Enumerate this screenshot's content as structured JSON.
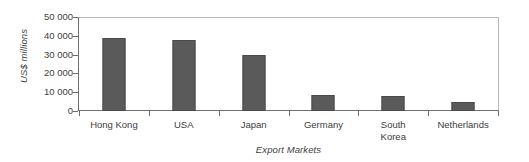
{
  "chart_data": {
    "type": "bar",
    "title": "",
    "xlabel": "Export Markets",
    "ylabel": "US$ millions",
    "categories": [
      "Hong Kong",
      "USA",
      "Japan",
      "Germany",
      "South\nKorea",
      "Netherlands"
    ],
    "values": [
      38800,
      37800,
      29800,
      8500,
      7800,
      5000
    ],
    "ylim": [
      0,
      50000
    ],
    "ytick_labels": [
      "50 000",
      "40 000",
      "30 000",
      "20 000",
      "10 000",
      "0"
    ],
    "ytick_values": [
      50000,
      40000,
      30000,
      20000,
      10000,
      0
    ],
    "grid": false,
    "legend": null,
    "bar_color": "#5a5a5a",
    "axis_color": "#6f6f6f",
    "frame_color": "#b9b9b9",
    "text_color": "#3d3d3d"
  }
}
